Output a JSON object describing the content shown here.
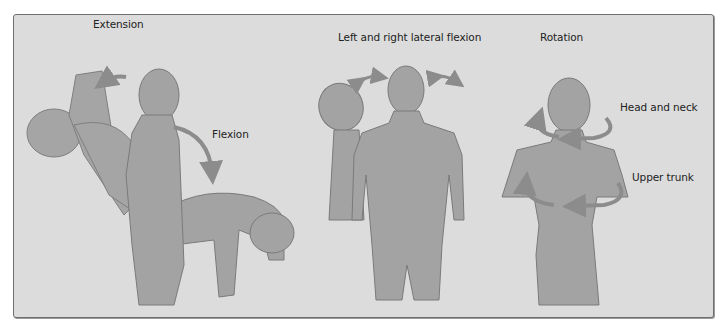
{
  "figure": {
    "background_color": "#dcdcdc",
    "figure_fill": "#a3a3a3",
    "figure_outline": "#7a7a7a",
    "arrow_color": "#8c8c8c",
    "panels": [
      {
        "id": "flexion-extension",
        "labels": {
          "extension": "Extension",
          "flexion": "Flexion"
        }
      },
      {
        "id": "lateral-flexion",
        "labels": {
          "title": "Left and right lateral flexion"
        }
      },
      {
        "id": "rotation",
        "labels": {
          "title": "Rotation",
          "head_and_neck": "Head and neck",
          "upper_trunk": "Upper trunk"
        }
      }
    ]
  }
}
